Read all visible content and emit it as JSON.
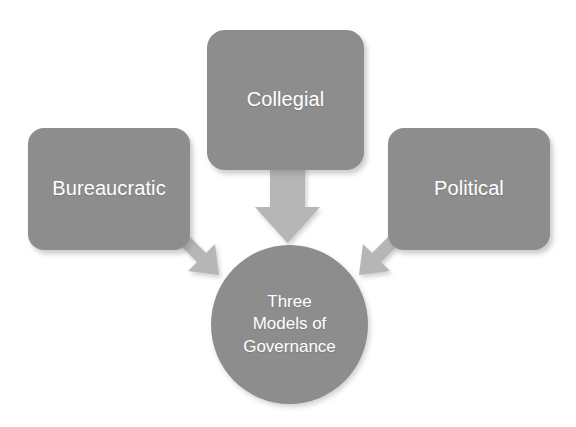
{
  "diagram": {
    "title": "Three Models of Governance",
    "type": "convergence-diagram",
    "background_color": "#ffffff",
    "node_color": "#8d8d8d",
    "arrow_color": "#b6b6b6",
    "text_color": "#ffffff",
    "nodes": [
      {
        "id": "bureaucratic",
        "label": "Bureaucratic",
        "shape": "rounded-rectangle",
        "position": "left"
      },
      {
        "id": "collegial",
        "label": "Collegial",
        "shape": "rounded-rectangle",
        "position": "top-center"
      },
      {
        "id": "political",
        "label": "Political",
        "shape": "rounded-rectangle",
        "position": "right"
      }
    ],
    "hub": {
      "id": "three-models-of-governance",
      "shape": "circle",
      "lines": [
        "Three",
        "Models of",
        "Governance"
      ],
      "line1": "Three",
      "line2": "Models of",
      "line3": "Governance"
    },
    "arrows": [
      {
        "id": "arrow-collegial-to-hub",
        "from": "collegial",
        "to": "hub",
        "direction": "down"
      },
      {
        "id": "arrow-bureaucratic-to-hub",
        "from": "bureaucratic",
        "to": "hub",
        "direction": "down-right"
      },
      {
        "id": "arrow-political-to-hub",
        "from": "political",
        "to": "hub",
        "direction": "down-left"
      }
    ]
  }
}
